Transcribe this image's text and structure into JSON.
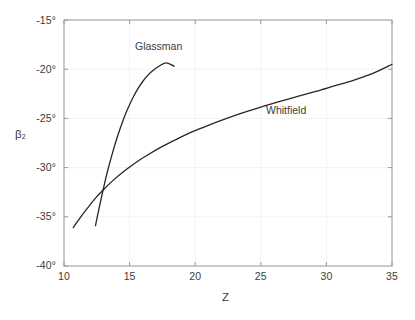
{
  "chart_data": {
    "type": "line",
    "title": "",
    "xlabel": "Z",
    "ylabel": "β₂",
    "xlim": [
      10,
      35
    ],
    "ylim": [
      -40,
      -15
    ],
    "xticks": [
      10,
      15,
      20,
      25,
      30,
      35
    ],
    "yticks": [
      -40,
      -35,
      -30,
      -25,
      -20,
      -15
    ],
    "xtick_labels": [
      "10",
      "15",
      "20",
      "25",
      "30",
      "35"
    ],
    "ytick_labels": [
      "-40°",
      "-35°",
      "-30°",
      "-25°",
      "-20°",
      "-15°"
    ],
    "grid": true,
    "legend": "inline-annotations",
    "line_color": "#262626",
    "axis_color": "#8c8c8c",
    "grid_color": "#f0f0f0",
    "text_color": "#3b3b3b",
    "series": [
      {
        "name": "Glassman",
        "label_position": {
          "x": 13.9,
          "y": -17.2
        },
        "points": [
          [
            12.4,
            -35.9
          ],
          [
            12.6,
            -34.6
          ],
          [
            12.8,
            -33.35
          ],
          [
            13.0,
            -32.15
          ],
          [
            13.2,
            -31.0
          ],
          [
            13.45,
            -29.7
          ],
          [
            13.7,
            -28.5
          ],
          [
            14.0,
            -27.15
          ],
          [
            14.3,
            -25.95
          ],
          [
            14.6,
            -24.85
          ],
          [
            14.9,
            -23.9
          ],
          [
            15.25,
            -22.9
          ],
          [
            15.6,
            -22.05
          ],
          [
            16.0,
            -21.25
          ],
          [
            16.4,
            -20.6
          ],
          [
            16.8,
            -20.1
          ],
          [
            17.3,
            -19.65
          ],
          [
            17.8,
            -19.35
          ],
          [
            18.4,
            -19.7
          ]
        ]
      },
      {
        "name": "Whitfield",
        "label_position": {
          "x": 24.2,
          "y": -24.1
        },
        "points": [
          [
            10.7,
            -36.1
          ],
          [
            11.2,
            -35.15
          ],
          [
            11.8,
            -34.1
          ],
          [
            12.4,
            -33.1
          ],
          [
            13.0,
            -32.25
          ],
          [
            13.7,
            -31.35
          ],
          [
            14.5,
            -30.45
          ],
          [
            15.4,
            -29.55
          ],
          [
            16.4,
            -28.7
          ],
          [
            17.5,
            -27.85
          ],
          [
            18.6,
            -27.1
          ],
          [
            19.8,
            -26.35
          ],
          [
            21.0,
            -25.7
          ],
          [
            22.3,
            -25.05
          ],
          [
            23.6,
            -24.45
          ],
          [
            25.0,
            -23.85
          ],
          [
            26.4,
            -23.3
          ],
          [
            27.8,
            -22.75
          ],
          [
            29.2,
            -22.25
          ],
          [
            30.6,
            -21.7
          ],
          [
            32.0,
            -21.15
          ],
          [
            33.5,
            -20.45
          ],
          [
            35.0,
            -19.5
          ]
        ]
      }
    ],
    "annotations": [
      {
        "text": "Glassman",
        "x": 13.9,
        "y": -17.2
      },
      {
        "text": "Whitfield",
        "x": 24.2,
        "y": -24.1
      }
    ]
  }
}
